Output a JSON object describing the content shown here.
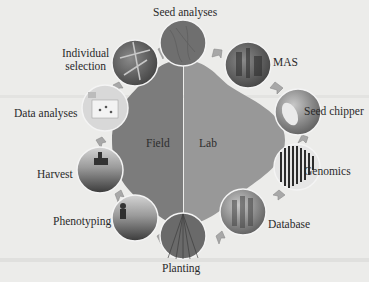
{
  "diagram": {
    "type": "cycle",
    "center": {
      "left_label": "Field",
      "right_label": "Lab"
    },
    "colors": {
      "field": "#7c7c7c",
      "lab": "#989898",
      "background": "#ececea",
      "arrow": "#a9a9a9"
    },
    "steps": [
      {
        "label": "Seed analyses"
      },
      {
        "label": "MAS"
      },
      {
        "label": "Seed chipper"
      },
      {
        "label": "Genomics"
      },
      {
        "label": "Database"
      },
      {
        "label": "Planting"
      },
      {
        "label": "Phenotyping"
      },
      {
        "label": "Harvest"
      },
      {
        "label": "Data analyses"
      },
      {
        "label": "Individual selection",
        "line1": "Individual",
        "line2": "selection"
      }
    ]
  }
}
